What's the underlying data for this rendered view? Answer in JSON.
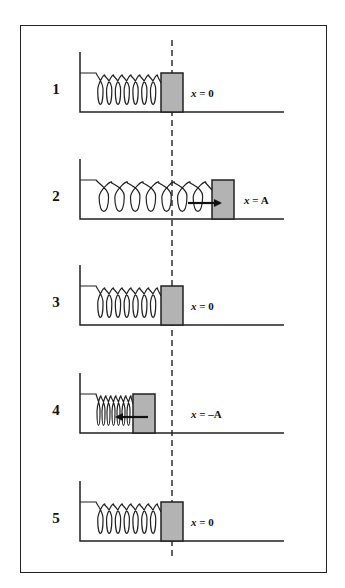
{
  "figure": {
    "colors": {
      "block_fill": "#b3b3b3",
      "stroke": "#222222",
      "background": "#ffffff"
    },
    "equilibrium_line": {
      "style": "dashed",
      "x": 172
    },
    "panels": [
      {
        "number": "1",
        "position_label": "x = 0",
        "x_var": "x",
        "x_val": "= 0",
        "block_x": 161,
        "arrow": "none"
      },
      {
        "number": "2",
        "position_label": "x = A",
        "x_var": "x",
        "x_val": "= A",
        "block_x": 212,
        "arrow": "right"
      },
      {
        "number": "3",
        "position_label": "x = 0",
        "x_var": "x",
        "x_val": "= 0",
        "block_x": 161,
        "arrow": "none"
      },
      {
        "number": "4",
        "position_label": "x = −A",
        "x_var": "x",
        "x_val": "= –A",
        "block_x": 133,
        "arrow": "left"
      },
      {
        "number": "5",
        "position_label": "x = 0",
        "x_var": "x",
        "x_val": "= 0",
        "block_x": 161,
        "arrow": "none"
      }
    ]
  }
}
